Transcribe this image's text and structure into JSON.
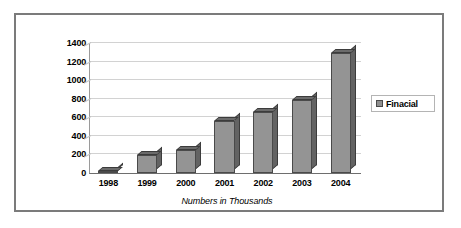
{
  "chart_data": {
    "type": "bar",
    "title": "",
    "subtitle": "",
    "caption": "Numbers in Thousands",
    "xlabel": "",
    "ylabel": "",
    "categories": [
      "1998",
      "1999",
      "2000",
      "2001",
      "2002",
      "2003",
      "2004"
    ],
    "series": [
      {
        "name": "Finacial",
        "values": [
          25,
          195,
          250,
          560,
          660,
          790,
          1290
        ]
      }
    ],
    "ylim": [
      0,
      1400
    ],
    "ytick_labels": [
      "1400",
      "1200",
      "1000",
      "800",
      "600",
      "400",
      "200",
      "0"
    ],
    "ytick_values": [
      1400,
      1200,
      1000,
      800,
      600,
      400,
      200,
      0
    ],
    "grid": true,
    "grid_axis": "y",
    "legend_position": "right",
    "legend_entries": [
      "Finacial"
    ],
    "style": "3d-column",
    "colors": {
      "bar_face": "#949494",
      "bar_top": "#6b6b6b",
      "bar_side": "#636363",
      "bar_outline": "#4a4a4a",
      "gridline": "#d2d2d2",
      "axis": "#6e6e6e",
      "frame_border": "#7b7b7b",
      "plot_background": "#ffffff",
      "text": "#000000"
    }
  },
  "legend": {
    "label": "Finacial",
    "swatch_icon": "legend-swatch-icon"
  },
  "caption": {
    "text": "Numbers in Thousands"
  }
}
